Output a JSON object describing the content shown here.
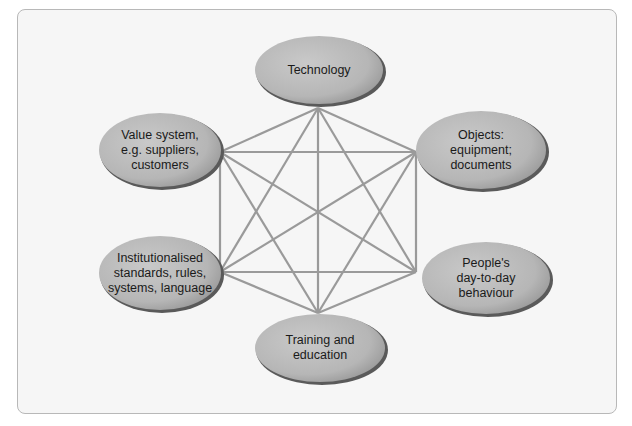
{
  "diagram": {
    "type": "fully-connected-network",
    "line_color": "#9a9a9a",
    "node_fill": "#b9b9b9",
    "node_rim": "#5a5a5a",
    "frame_bg": "#f6f6f6",
    "nodes": [
      {
        "id": "technology",
        "label": "Technology",
        "cx": 319,
        "cy": 70,
        "rx": 65,
        "ry": 35,
        "anchor": [
          318,
          108
        ]
      },
      {
        "id": "objects",
        "label": "Objects:\nequipment;\ndocuments",
        "cx": 481,
        "cy": 150,
        "rx": 66,
        "ry": 40,
        "anchor": [
          416,
          152
        ]
      },
      {
        "id": "peoples-behaviour",
        "label": "People's\nday-to-day\nbehaviour",
        "cx": 486,
        "cy": 278,
        "rx": 65,
        "ry": 37,
        "anchor": [
          416,
          272
        ]
      },
      {
        "id": "training",
        "label": "Training and\neducation",
        "cx": 320,
        "cy": 348,
        "rx": 66,
        "ry": 35,
        "anchor": [
          318,
          313
        ]
      },
      {
        "id": "institutionalised",
        "label": "Institutionalised\nstandards, rules,\nsystems, language",
        "cx": 160,
        "cy": 273,
        "rx": 62,
        "ry": 38,
        "anchor": [
          220,
          272
        ]
      },
      {
        "id": "value-system",
        "label": "Value system,\ne.g. suppliers,\ncustomers",
        "cx": 160,
        "cy": 150,
        "rx": 62,
        "ry": 38,
        "anchor": [
          220,
          152
        ]
      }
    ],
    "edges": "all-pairs"
  }
}
